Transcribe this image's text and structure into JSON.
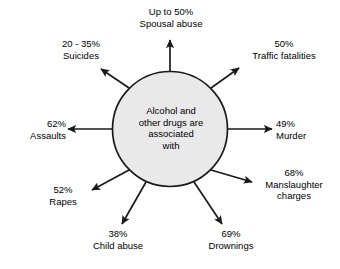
{
  "diagram": {
    "type": "radial-spoke",
    "center": {
      "shape": "circle",
      "fill_color": "#e9e9e9",
      "stroke_color": "#1a1a1a",
      "lines": [
        "Alcohol and",
        "other drugs are",
        "associated",
        "with"
      ]
    },
    "arrow_color": "#1a1a1a",
    "spokes": [
      {
        "id": "spousal",
        "direction": "up",
        "percent": "Up to 50%",
        "name": "Spousal abuse"
      },
      {
        "id": "traffic",
        "direction": "up-right",
        "percent": "50%",
        "name": "Traffic fatalities"
      },
      {
        "id": "murder",
        "direction": "right",
        "percent": "49%",
        "name": "Murder"
      },
      {
        "id": "mansl",
        "direction": "down-right",
        "percent": "68%",
        "name": "Manslaughter",
        "name2": "charges"
      },
      {
        "id": "drown",
        "direction": "down",
        "percent": "69%",
        "name": "Drownings"
      },
      {
        "id": "child",
        "direction": "down-left",
        "percent": "38%",
        "name": "Child abuse"
      },
      {
        "id": "rapes",
        "direction": "left-down",
        "percent": "52%",
        "name": "Rapes"
      },
      {
        "id": "assaults",
        "direction": "left",
        "percent": "62%",
        "name": "Assaults"
      },
      {
        "id": "suicides",
        "direction": "up-left",
        "percent": "20 - 35%",
        "name": "Suicides"
      }
    ]
  }
}
